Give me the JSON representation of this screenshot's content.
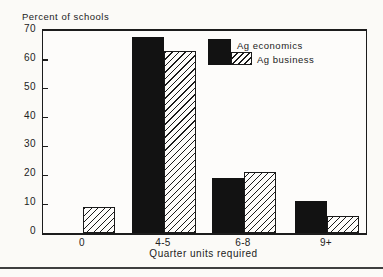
{
  "chart_data": {
    "type": "bar",
    "title": "Percent of schools",
    "xlabel": "Quarter units required",
    "ylabel": "Percent of schools",
    "categories": [
      "0",
      "4-5",
      "6-8",
      "9+"
    ],
    "series": [
      {
        "name": "Ag economics",
        "style": "solid-black",
        "values": [
          0,
          68,
          19,
          11
        ]
      },
      {
        "name": "Ag business",
        "style": "diagonal-hatch",
        "values": [
          9,
          63,
          21,
          6
        ]
      }
    ],
    "ylim": [
      0,
      70
    ],
    "yticks": [
      0,
      10,
      20,
      30,
      40,
      50,
      60,
      70
    ],
    "grid": false,
    "legend_position": "top-right-inside"
  },
  "colors": {
    "ink": "#1e1e1e",
    "background": "#fbfaf7",
    "bar_fill": "#121212",
    "hatch_line": "#1a1a1a",
    "divider": "#3f3f3f"
  }
}
